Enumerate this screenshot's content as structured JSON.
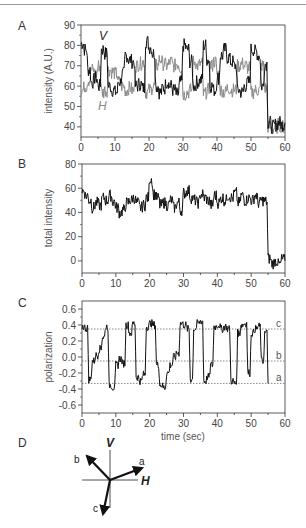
{
  "figure": {
    "panels": [
      "A",
      "B",
      "C",
      "D"
    ]
  },
  "chart_data": [
    {
      "panel": "A",
      "type": "line",
      "title": "",
      "xlabel": "",
      "ylabel": "intensity (A.U.)",
      "xlim": [
        0,
        60
      ],
      "ylim": [
        35,
        90
      ],
      "xticks": [
        "0",
        "10",
        "20",
        "30",
        "40",
        "50",
        "60"
      ],
      "yticks": [
        "40",
        "50",
        "60",
        "70",
        "80",
        "90"
      ],
      "grid": false,
      "series": [
        {
          "name": "V",
          "color": "#111111",
          "x": [
            0,
            1,
            2,
            3,
            4,
            5,
            6,
            7,
            8,
            9,
            10,
            11,
            12,
            13,
            14,
            15,
            16,
            17,
            18,
            19,
            20,
            21,
            22,
            23,
            24,
            25,
            26,
            27,
            28,
            29,
            30,
            31,
            32,
            33,
            34,
            35,
            36,
            37,
            38,
            39,
            40,
            41,
            42,
            43,
            44,
            45,
            46,
            47,
            48,
            49,
            50,
            51,
            52,
            53,
            54,
            55,
            56,
            57,
            58,
            59,
            60
          ],
          "values": [
            81,
            78,
            68,
            62,
            64,
            60,
            78,
            76,
            60,
            58,
            57,
            62,
            66,
            75,
            73,
            72,
            60,
            61,
            59,
            82,
            79,
            76,
            60,
            57,
            59,
            62,
            60,
            58,
            56,
            62,
            80,
            78,
            72,
            60,
            62,
            63,
            80,
            73,
            60,
            58,
            64,
            75,
            78,
            74,
            72,
            70,
            58,
            57,
            60,
            62,
            78,
            77,
            75,
            60,
            71,
            42,
            40,
            41,
            42,
            41,
            42
          ]
        },
        {
          "name": "H",
          "color": "#8a8a8a",
          "x": [
            0,
            1,
            2,
            3,
            4,
            5,
            6,
            7,
            8,
            9,
            10,
            11,
            12,
            13,
            14,
            15,
            16,
            17,
            18,
            19,
            20,
            21,
            22,
            23,
            24,
            25,
            26,
            27,
            28,
            29,
            30,
            31,
            32,
            33,
            34,
            35,
            36,
            37,
            38,
            39,
            40,
            41,
            42,
            43,
            44,
            45,
            46,
            47,
            48,
            49,
            50,
            51,
            52,
            53,
            54,
            55,
            56,
            57,
            58,
            59,
            60
          ],
          "values": [
            58,
            60,
            63,
            68,
            66,
            70,
            57,
            58,
            68,
            67,
            66,
            62,
            60,
            58,
            59,
            58,
            70,
            71,
            72,
            57,
            58,
            60,
            70,
            73,
            71,
            70,
            72,
            70,
            71,
            69,
            56,
            57,
            58,
            72,
            70,
            71,
            56,
            58,
            70,
            72,
            66,
            58,
            57,
            59,
            58,
            58,
            70,
            71,
            70,
            69,
            57,
            58,
            58,
            70,
            59,
            40,
            39,
            40,
            41,
            40,
            41
          ]
        }
      ],
      "annotations": [
        {
          "text": "V",
          "x": 6,
          "y": 86
        },
        {
          "text": "H",
          "x": 6,
          "y": 49
        }
      ]
    },
    {
      "panel": "B",
      "type": "line",
      "xlabel": "",
      "ylabel": "total intensity",
      "xlim": [
        0,
        60
      ],
      "ylim": [
        -10,
        80
      ],
      "xticks": [
        "0",
        "10",
        "20",
        "30",
        "40",
        "50",
        "60"
      ],
      "yticks": [
        "0",
        "20",
        "40",
        "60",
        "80"
      ],
      "grid": false,
      "series": [
        {
          "name": "total",
          "color": "#111111",
          "x": [
            0,
            1,
            2,
            3,
            4,
            5,
            6,
            7,
            8,
            9,
            10,
            11,
            12,
            13,
            14,
            15,
            16,
            17,
            18,
            19,
            20,
            21,
            22,
            23,
            24,
            25,
            26,
            27,
            28,
            29,
            30,
            31,
            32,
            33,
            34,
            35,
            36,
            37,
            38,
            39,
            40,
            41,
            42,
            43,
            44,
            45,
            46,
            47,
            48,
            49,
            50,
            51,
            52,
            53,
            54,
            55,
            56,
            57,
            58,
            59,
            60
          ],
          "values": [
            58,
            54,
            50,
            44,
            48,
            46,
            52,
            50,
            54,
            49,
            44,
            40,
            42,
            48,
            50,
            52,
            48,
            44,
            46,
            52,
            68,
            55,
            52,
            46,
            48,
            46,
            50,
            44,
            48,
            42,
            56,
            58,
            52,
            50,
            48,
            55,
            52,
            50,
            46,
            54,
            48,
            52,
            50,
            54,
            52,
            56,
            48,
            54,
            50,
            52,
            50,
            54,
            48,
            50,
            49,
            2,
            -2,
            0,
            -3,
            1,
            0
          ]
        }
      ]
    },
    {
      "panel": "C",
      "type": "line",
      "xlabel": "time (sec)",
      "ylabel": "polarization",
      "xlim": [
        0,
        60
      ],
      "ylim": [
        -0.7,
        0.7
      ],
      "xticks": [
        "0",
        "10",
        "20",
        "30",
        "40",
        "50",
        "60"
      ],
      "yticks": [
        "0.6",
        "0.4",
        "0.2",
        "0.0",
        "-0.2",
        "-0.4",
        "-0.6"
      ],
      "grid": false,
      "reference_lines": [
        {
          "label": "c",
          "y": 0.35
        },
        {
          "label": "b",
          "y": -0.05
        },
        {
          "label": "a",
          "y": -0.33
        }
      ],
      "series": [
        {
          "name": "polarization",
          "color": "#111111",
          "x": [
            0,
            1,
            2,
            3,
            4,
            5,
            6,
            7,
            8,
            9,
            10,
            11,
            12,
            13,
            14,
            15,
            16,
            17,
            18,
            19,
            20,
            21,
            22,
            23,
            24,
            25,
            26,
            27,
            28,
            29,
            30,
            31,
            32,
            33,
            34,
            35,
            36,
            37,
            38,
            39,
            40,
            41,
            42,
            43,
            44,
            45,
            46,
            47,
            48,
            49,
            50,
            51,
            52,
            53,
            54,
            55
          ],
          "values": [
            0.38,
            0.36,
            -0.28,
            -0.05,
            0.02,
            0.1,
            0.25,
            0.38,
            -0.35,
            -0.38,
            -0.1,
            -0.02,
            -0.08,
            0.4,
            0.3,
            0.42,
            -0.25,
            -0.3,
            -0.22,
            0.38,
            0.42,
            0.4,
            -0.1,
            -0.35,
            -0.38,
            -0.2,
            -0.1,
            0.0,
            0.05,
            0.42,
            0.4,
            0.35,
            -0.28,
            0.35,
            0.42,
            0.45,
            -0.3,
            -0.25,
            -0.1,
            0.38,
            0.4,
            0.35,
            0.38,
            0.35,
            -0.3,
            -0.33,
            0.3,
            0.4,
            0.42,
            -0.2,
            0.3,
            0.35,
            0.38,
            -0.05,
            0.3,
            -0.33
          ]
        }
      ]
    },
    {
      "panel": "D",
      "type": "diagram",
      "axes": {
        "vertical": "V",
        "horizontal": "H"
      },
      "vectors": [
        {
          "label": "a",
          "angle_deg": 20
        },
        {
          "label": "b",
          "angle_deg": 130
        },
        {
          "label": "c",
          "angle_deg": 255
        }
      ]
    }
  ],
  "labels": {
    "panelA": "A",
    "panelB": "B",
    "panelC": "C",
    "panelD": "D",
    "ylabelA": "intensity (A.U.)",
    "ylabelB": "total intensity",
    "ylabelC": "polarization",
    "xlabelC": "time (sec)",
    "seriesV": "V",
    "seriesH": "H",
    "refC": "c",
    "refB": "b",
    "refA": "a",
    "diagV": "V",
    "diagH": "H",
    "vecA": "a",
    "vecB": "b",
    "vecC": "c"
  }
}
